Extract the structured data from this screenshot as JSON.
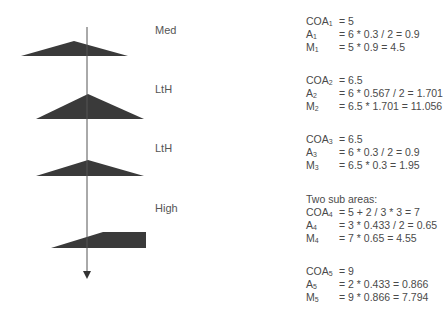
{
  "diagram": {
    "axis": {
      "x": 87,
      "y_top": 27,
      "y_bottom": 279,
      "direction": "down"
    },
    "shapes": [
      {
        "name": "shape-1",
        "type": "triangle",
        "points": "21,56 74,41 128,56",
        "fill": "#3a3a3a"
      },
      {
        "name": "shape-2",
        "type": "triangle",
        "points": "36,119 88,94 144,119",
        "fill": "#3a3a3a"
      },
      {
        "name": "shape-3",
        "type": "triangle",
        "points": "36,176 88,160 144,176",
        "fill": "#3a3a3a"
      },
      {
        "name": "shape-4",
        "type": "trapezoid",
        "points": "51,248 103,232 146,232 146,248",
        "fill": "#3a3a3a"
      }
    ],
    "labels": [
      {
        "text": "Med",
        "top": 24
      },
      {
        "text": "LtH",
        "top": 83
      },
      {
        "text": "LtH",
        "top": 142
      },
      {
        "text": "High",
        "top": 202
      }
    ]
  },
  "calculations": {
    "block1": {
      "coa": {
        "key": "COA",
        "sub": "1",
        "val": "= 5"
      },
      "a": {
        "key": "A",
        "sub": "1",
        "val": "= 6 * 0.3 / 2 = 0.9"
      },
      "m": {
        "key": "M",
        "sub": "1",
        "val": "= 5 * 0.9 = 4.5"
      }
    },
    "block2": {
      "coa": {
        "key": "COA",
        "sub": "2",
        "val": "= 6.5"
      },
      "a": {
        "key": "A",
        "sub": "2",
        "val": "= 6 * 0.567 / 2 = 1.701"
      },
      "m": {
        "key": "M",
        "sub": "2",
        "val": "= 6.5 * 1.701 = 11.056"
      }
    },
    "block3": {
      "coa": {
        "key": "COA",
        "sub": "3",
        "val": "= 6.5"
      },
      "a": {
        "key": "A",
        "sub": "3",
        "val": "= 6 * 0.3 / 2 = 0.9"
      },
      "m": {
        "key": "M",
        "sub": "3",
        "val": "= 6.5 * 0.3 = 1.95"
      }
    },
    "block4": {
      "note": "Two sub areas:",
      "coa": {
        "key": "COA",
        "sub": "4",
        "val": "= 5 + 2 / 3 * 3 = 7"
      },
      "a": {
        "key": "A",
        "sub": "4",
        "val": "= 3 * 0.433 / 2 = 0.65"
      },
      "m": {
        "key": "M",
        "sub": "4",
        "val": "= 7 * 0.65 = 4.55"
      }
    },
    "block5": {
      "coa": {
        "key": "COA",
        "sub": "5",
        "val": "= 9"
      },
      "a": {
        "key": "A",
        "sub": "5",
        "val": "= 2 * 0.433 = 0.866"
      },
      "m": {
        "key": "M",
        "sub": "5",
        "val": "= 9 * 0.866 = 7.794"
      }
    }
  }
}
